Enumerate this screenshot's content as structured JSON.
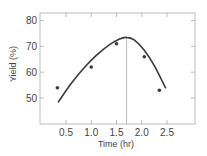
{
  "chart_data": {
    "type": "line",
    "title": "",
    "xlabel": "Time (hr)",
    "ylabel": "Yield (%)",
    "xlim": [
      0.0,
      3.1
    ],
    "ylim": [
      40,
      82
    ],
    "xticks": [
      0.5,
      1.0,
      1.5,
      2.0,
      2.5
    ],
    "xtick_labels": [
      "0.5",
      "1.0",
      "1.5",
      "2.0",
      "2.5"
    ],
    "yticks": [
      50,
      60,
      70,
      80
    ],
    "ytick_labels": [
      "50",
      "60",
      "70",
      "80"
    ],
    "grid": false,
    "legend": null,
    "series": [
      {
        "name": "Observed yield",
        "kind": "scatter",
        "x": [
          0.33,
          1.0,
          1.5,
          2.05,
          2.35
        ],
        "y": [
          54,
          62,
          71,
          66,
          53
        ]
      },
      {
        "name": "Fitted curve",
        "kind": "line",
        "x": [
          0.35,
          0.6,
          0.85,
          1.1,
          1.35,
          1.55,
          1.7,
          1.85,
          2.05,
          2.25,
          2.47
        ],
        "y": [
          48.5,
          55.5,
          61.5,
          66.5,
          70.5,
          72.8,
          73.5,
          72.5,
          68.5,
          62.5,
          54
        ]
      }
    ],
    "annotations": [
      {
        "type": "vline",
        "x": 1.7,
        "label": "optimum time"
      }
    ]
  },
  "colors": {
    "curve": "#3a3a3a",
    "points": "#3a3a3a",
    "frame": "#aaaaaa",
    "vline": "#aaaaaa",
    "text": "#444444"
  }
}
